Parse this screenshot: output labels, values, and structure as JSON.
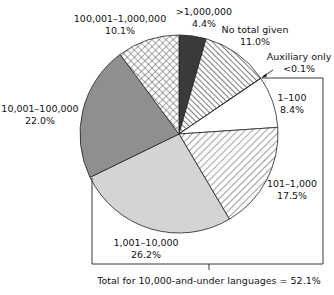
{
  "chart_data": {
    "type": "pie",
    "title": "",
    "start": "12 o'clock, clockwise",
    "slices": [
      {
        "label": ">1,000,000",
        "value": 4.4,
        "value_label": "4.4%",
        "fill": "dark",
        "color": "#3a3a3a"
      },
      {
        "label": "No total given",
        "value": 11.0,
        "value_label": "11.0%",
        "fill": "hatch-back",
        "color": "#555555"
      },
      {
        "label": "Auxiliary only",
        "value": 0.05,
        "value_label": "<0.1%",
        "fill": "white",
        "color": "#ffffff"
      },
      {
        "label": "1–100",
        "value": 8.4,
        "value_label": "8.4%",
        "fill": "white",
        "color": "#ffffff"
      },
      {
        "label": "101–1,000",
        "value": 17.5,
        "value_label": "17.5%",
        "fill": "hatch-forward",
        "color": "#666666"
      },
      {
        "label": "1,001–10,000",
        "value": 26.2,
        "value_label": "26.2%",
        "fill": "light-gray",
        "color": "#d2d2d2"
      },
      {
        "label": "10,001–100,000",
        "value": 22.0,
        "value_label": "22.0%",
        "fill": "mid-gray",
        "color": "#8e8e8e"
      },
      {
        "label": "100,001–1,000,000",
        "value": 10.1,
        "value_label": "10.1%",
        "fill": "crosshatch",
        "color": "#777777"
      }
    ],
    "annotations": [
      {
        "text": "Total for 10,000-and-under languages = 52.1%",
        "brackets": [
          "Auxiliary only",
          "1–100",
          "101–1,000",
          "1,001–10,000"
        ]
      }
    ]
  }
}
